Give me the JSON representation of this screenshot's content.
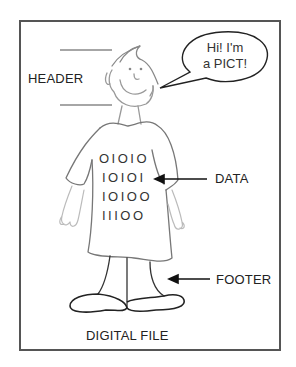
{
  "figure": {
    "title": "DIGITAL FILE",
    "labels": {
      "header": "HEADER",
      "data": "DATA",
      "footer": "FOOTER"
    },
    "speech_bubble": {
      "line1": "Hi! I'm",
      "line2": "a PICT!"
    },
    "binary_rows": [
      "OIOIO",
      "IOIOI",
      "IOIOO",
      "IIIOO"
    ],
    "colors": {
      "border": "#555555",
      "sketch": "#888888",
      "ink": "#222222"
    }
  }
}
